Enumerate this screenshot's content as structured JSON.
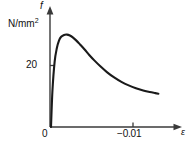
{
  "figure": {
    "background_color": "#ffffff",
    "line_color": "#1a1a1a",
    "axis_color": "#3a3a3a"
  },
  "axes": {
    "y": {
      "quantity_symbol": "f",
      "unit_text": "N/mm",
      "unit_exponent": "2",
      "ticks": [
        {
          "label": "20",
          "value": 20
        }
      ],
      "origin_label": "0"
    },
    "x": {
      "quantity_symbol": "ε",
      "ticks": [
        {
          "label": "−0.01",
          "value": -0.01
        }
      ]
    }
  },
  "chart_data": {
    "type": "line",
    "title": "",
    "xlabel": "ε",
    "ylabel": "f",
    "yunit": "N/mm2",
    "grid": false,
    "legend": "none",
    "xlim": [
      0,
      -0.0155
    ],
    "ylim": [
      0,
      40
    ],
    "x_tick_values": [
      0,
      -0.01
    ],
    "x_tick_labels": [
      "0",
      "−0.01"
    ],
    "y_tick_values": [
      20
    ],
    "y_tick_labels": [
      "20"
    ],
    "series": [
      {
        "name": "concrete compressive stress-strain",
        "x": [
          0.0,
          -0.0002,
          -0.0005,
          -0.0008,
          -0.0011,
          -0.0014,
          -0.0018,
          -0.0022,
          -0.0026,
          -0.003,
          -0.0035,
          -0.004,
          -0.0046,
          -0.0053,
          -0.006,
          -0.0068,
          -0.0077,
          -0.0087,
          -0.0097,
          -0.0107,
          -0.0117,
          -0.0127,
          -0.0136,
          -0.0143,
          -0.0148
        ],
        "y": [
          0.0,
          11.5,
          20.5,
          24.8,
          27.2,
          28.4,
          29.0,
          29.1,
          28.8,
          28.2,
          27.2,
          26.0,
          24.5,
          22.6,
          20.9,
          19.1,
          17.3,
          15.6,
          14.2,
          13.1,
          12.2,
          11.5,
          11.0,
          10.7,
          10.5
        ]
      }
    ],
    "annotations": {
      "peak_value": 29.1,
      "peak_strain": -0.0022
    }
  }
}
